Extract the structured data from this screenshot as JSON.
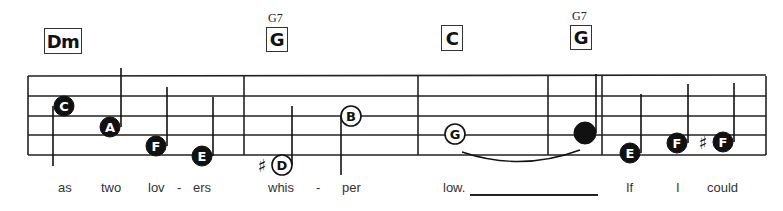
{
  "colors": {
    "ink": "#111111",
    "staff": "#222222",
    "lyric": "#333333",
    "paper": "#ffffff"
  },
  "staff": {
    "left": 28,
    "right": 766,
    "lines_y": [
      76,
      96,
      116,
      135,
      155
    ],
    "barlines_x": [
      28,
      244,
      418,
      548,
      602,
      766
    ]
  },
  "chords": [
    {
      "label": "Dm",
      "x": 44,
      "y": 28,
      "w": 38,
      "h": 26,
      "alt": ""
    },
    {
      "label": "G",
      "x": 266,
      "y": 27,
      "w": 22,
      "h": 25,
      "alt": "G7",
      "alt_x": 268,
      "alt_y": 11
    },
    {
      "label": "C",
      "x": 441,
      "y": 25,
      "w": 22,
      "h": 26,
      "alt": ""
    },
    {
      "label": "G",
      "x": 570,
      "y": 25,
      "w": 22,
      "h": 25,
      "alt": "G7",
      "alt_x": 572,
      "alt_y": 9
    }
  ],
  "notes": [
    {
      "name": "C",
      "x": 64,
      "y": 106,
      "filled": true,
      "letter": true,
      "stem": "down",
      "stem_x": 53,
      "stem_y1": 106,
      "stem_y2": 166
    },
    {
      "name": "A",
      "x": 110,
      "y": 127,
      "filled": true,
      "letter": true,
      "stem": "up",
      "stem_x": 121,
      "stem_y1": 127,
      "stem_y2": 68
    },
    {
      "name": "F",
      "x": 156,
      "y": 146,
      "filled": true,
      "letter": true,
      "stem": "up",
      "stem_x": 167,
      "stem_y1": 146,
      "stem_y2": 87
    },
    {
      "name": "E",
      "x": 202,
      "y": 156,
      "filled": true,
      "letter": true,
      "stem": "up",
      "stem_x": 213,
      "stem_y1": 156,
      "stem_y2": 97
    },
    {
      "name": "D",
      "x": 282,
      "y": 165,
      "filled": false,
      "letter": true,
      "sharp": true,
      "stem": "up",
      "stem_x": 292,
      "stem_y1": 165,
      "stem_y2": 106
    },
    {
      "name": "B",
      "x": 351,
      "y": 116,
      "filled": false,
      "letter": true,
      "stem": "down",
      "stem_x": 341,
      "stem_y1": 116,
      "stem_y2": 175
    },
    {
      "name": "G",
      "x": 455,
      "y": 134,
      "filled": false,
      "letter": true,
      "stem": "none"
    },
    {
      "name": "G",
      "x": 585,
      "y": 133,
      "filled": true,
      "letter": false,
      "stem": "up",
      "stem_x": 596,
      "stem_y1": 133,
      "stem_y2": 74
    },
    {
      "name": "E",
      "x": 630,
      "y": 153,
      "filled": true,
      "letter": true,
      "stem": "up",
      "stem_x": 641,
      "stem_y1": 153,
      "stem_y2": 94
    },
    {
      "name": "F",
      "x": 677,
      "y": 143,
      "filled": true,
      "letter": true,
      "stem": "up",
      "stem_x": 688,
      "stem_y1": 143,
      "stem_y2": 84
    },
    {
      "name": "F",
      "x": 723,
      "y": 142,
      "filled": true,
      "letter": true,
      "sharp": true,
      "stem": "up",
      "stem_x": 734,
      "stem_y1": 142,
      "stem_y2": 83
    }
  ],
  "tie": {
    "from_x": 462,
    "to_x": 580,
    "y": 152,
    "depth": 10
  },
  "lyrics": [
    {
      "text": "as",
      "x": 58
    },
    {
      "text": "two",
      "x": 101
    },
    {
      "text": "lov",
      "x": 148
    },
    {
      "text": "-",
      "x": 177
    },
    {
      "text": "ers",
      "x": 193
    },
    {
      "text": "whis",
      "x": 268
    },
    {
      "text": "-",
      "x": 316
    },
    {
      "text": "per",
      "x": 342
    },
    {
      "text": "low.",
      "x": 443
    },
    {
      "text": "If",
      "x": 626
    },
    {
      "text": "I",
      "x": 676
    },
    {
      "text": "could",
      "x": 707
    }
  ],
  "extender": {
    "x1": 470,
    "x2": 598
  }
}
